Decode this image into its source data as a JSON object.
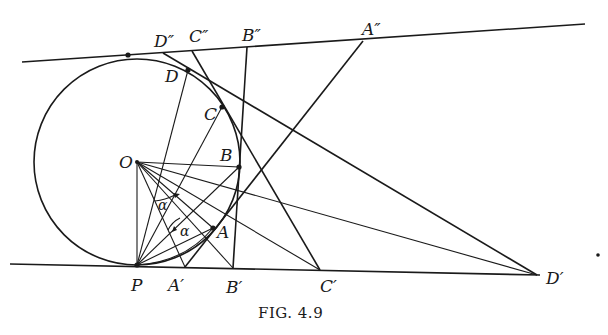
{
  "figure": {
    "caption": "Fig. 4.9",
    "caption_display": "FIG. 4.9"
  },
  "labels": {
    "O": "O",
    "P": "P",
    "A": "A",
    "B": "B",
    "C": "C",
    "D": "D",
    "A1": "A′",
    "B1": "B′",
    "C1": "C′",
    "D1": "D′",
    "A2": "A″",
    "B2": "B″",
    "C2": "C″",
    "D2": "D″",
    "alpha1": "α",
    "alpha2": "α"
  },
  "geometry": {
    "circle": {
      "center": [
        137,
        162
      ],
      "radius": 103
    },
    "points": {
      "O": [
        137,
        162
      ],
      "P": [
        137,
        265
      ],
      "T": [
        128,
        55
      ],
      "A": [
        213,
        228
      ],
      "B": [
        239,
        167
      ],
      "C": [
        222,
        107
      ],
      "D": [
        188,
        70
      ],
      "A1": [
        185,
        267
      ],
      "B1": [
        233,
        268
      ],
      "C1": [
        320,
        270
      ],
      "D1": [
        537,
        275
      ],
      "A2": [
        363,
        41
      ],
      "B2": [
        247,
        47
      ],
      "C2": [
        192,
        51
      ],
      "D2": [
        163,
        53
      ]
    },
    "top_tangent": [
      [
        22,
        62
      ],
      [
        585,
        24
      ]
    ],
    "bottom_tangent": [
      [
        10,
        264
      ],
      [
        540,
        275
      ]
    ]
  }
}
